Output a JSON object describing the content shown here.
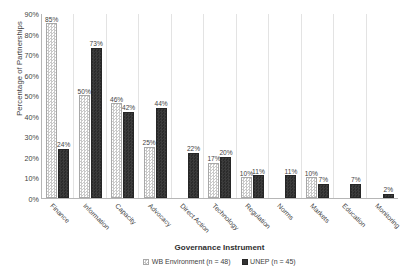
{
  "chart_data": {
    "type": "bar",
    "title": "",
    "subtitle": "",
    "xlabel": "Governance Instrument",
    "ylabel": "Percentage of Partnerships",
    "ylim": [
      0,
      90
    ],
    "y_tick_step": 10,
    "y_tick_labels": [
      "90%",
      "80%",
      "70%",
      "60%",
      "50%",
      "40%",
      "30%",
      "20%",
      "10%",
      "0%"
    ],
    "y_tick_values": [
      90,
      80,
      70,
      60,
      50,
      40,
      30,
      20,
      10,
      0
    ],
    "grid": false,
    "legend_position": "bottom",
    "categories": [
      "Finance",
      "Information",
      "Capacity",
      "Advocacy",
      "Direct Action",
      "Technology",
      "Regulation",
      "Norms",
      "Markets",
      "Education",
      "Monitoring"
    ],
    "series": [
      {
        "name": "WB Environment (n = 48)",
        "key": "wb",
        "color": "#c9c9c9",
        "pattern": "checkerboard-light",
        "values": [
          85,
          50,
          46,
          25,
          null,
          17,
          10,
          null,
          10,
          null,
          null
        ],
        "labels": [
          "85%",
          "50%",
          "46%",
          "25%",
          "",
          "17%",
          "10%",
          "",
          "10%",
          "",
          ""
        ]
      },
      {
        "name": "UNEP (n = 45)",
        "key": "unep",
        "color": "#333333",
        "pattern": "solid-dark",
        "values": [
          24,
          73,
          42,
          44,
          22,
          20,
          11,
          11,
          7,
          7,
          2
        ],
        "labels": [
          "24%",
          "73%",
          "42%",
          "44%",
          "22%",
          "20%",
          "11%",
          "11%",
          "7%",
          "7%",
          "2%"
        ]
      }
    ]
  }
}
